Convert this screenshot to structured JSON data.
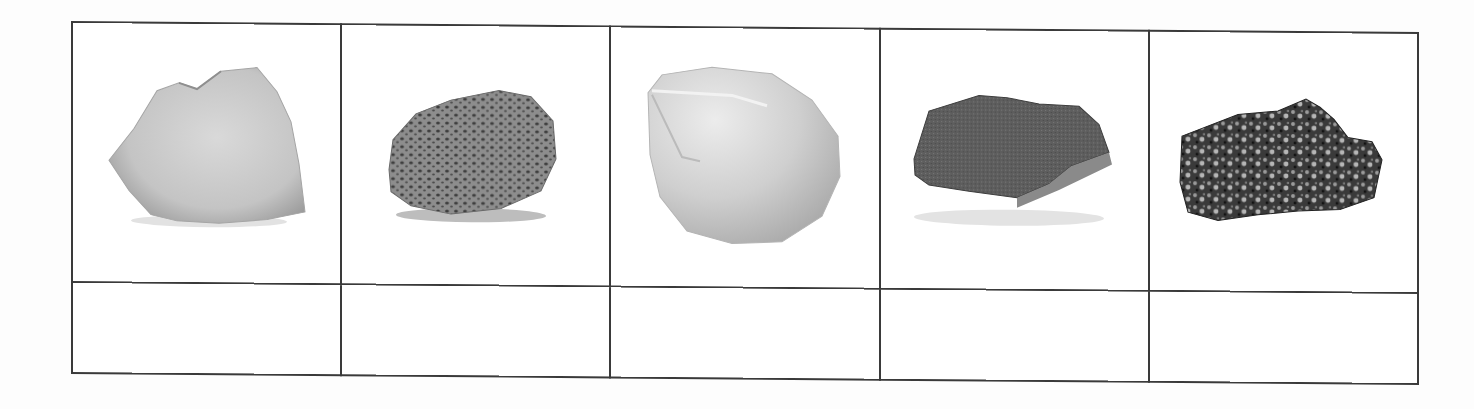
{
  "worksheet": {
    "title": "",
    "rows": [
      {
        "kind": "images",
        "cells": [
          {
            "icon": "quartzite-rock-icon",
            "description": "light gray rock with rough angular faces",
            "fill": "#c9c9c9",
            "shade": "#9a9a9a",
            "texture": "smooth"
          },
          {
            "icon": "pumice-rock-icon",
            "description": "gray porous rock full of small holes",
            "fill": "#8d8d8d",
            "shade": "#555555",
            "texture": "porous"
          },
          {
            "icon": "chalk-rock-icon",
            "description": "pale rounded smooth rock",
            "fill": "#d6d6d6",
            "shade": "#a8a8a8",
            "texture": "smooth"
          },
          {
            "icon": "sandstone-rock-icon",
            "description": "dark gray grainy flat rock",
            "fill": "#5e5e5e",
            "shade": "#3a3a3a",
            "texture": "grainy"
          },
          {
            "icon": "granite-rock-icon",
            "description": "speckled black and white crystalline rock",
            "fill": "#4a4a4a",
            "shade": "#1e1e1e",
            "texture": "speckled"
          }
        ]
      },
      {
        "kind": "labels",
        "cells": [
          "",
          "",
          "",
          "",
          ""
        ]
      }
    ],
    "border_color": "#3a3a3a"
  }
}
